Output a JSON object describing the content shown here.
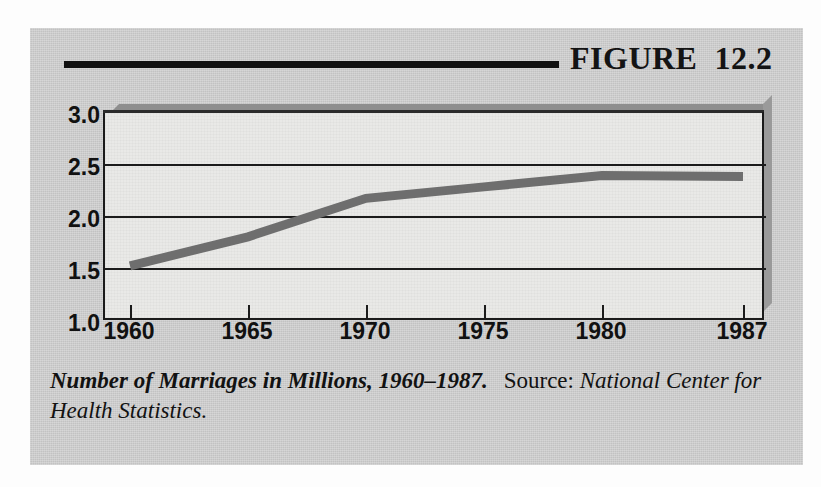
{
  "figure": {
    "title": "FIGURE  12.2",
    "rule_icon": "horizontal-rule-icon"
  },
  "caption": {
    "main": "Number of Marriages in Millions, 1960–1987.",
    "source_label": "Source:",
    "source_value": "National Center for Health Statistics."
  },
  "chart_data": {
    "type": "line",
    "xlabel": "",
    "ylabel": "",
    "x": [
      1960,
      1965,
      1970,
      1975,
      1980,
      1987
    ],
    "xticklabels": [
      "1960",
      "1965",
      "1970",
      "1975",
      "1980",
      "1987"
    ],
    "yticklabels": [
      "3.0",
      "2.5",
      "2.0",
      "1.5",
      "1.0"
    ],
    "yticks": [
      3.0,
      2.5,
      2.0,
      1.5,
      1.0
    ],
    "xlim": [
      1960,
      1987
    ],
    "ylim": [
      1.0,
      3.0
    ],
    "grid": true,
    "legend": false,
    "line_color": "#6e6e6e",
    "series": [
      {
        "name": "Number of Marriages (millions)",
        "values": [
          1.52,
          1.8,
          2.17,
          2.28,
          2.39,
          2.38
        ]
      }
    ]
  },
  "colors": {
    "panel_background": "#cfcfcf",
    "plot_background": "#e9e9e7",
    "axis": "#1b1b1b",
    "data_line": "#6e6e6e",
    "text": "#121212"
  }
}
